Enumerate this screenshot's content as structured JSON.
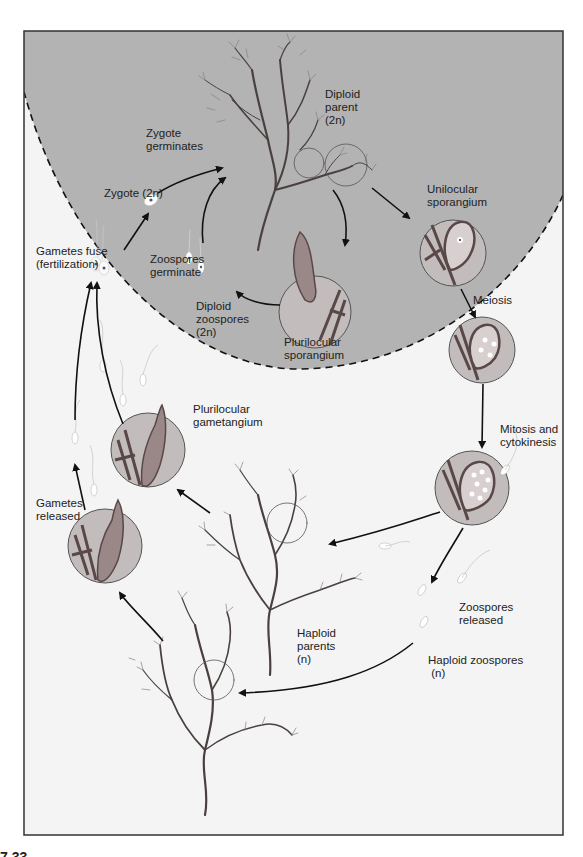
{
  "figure": {
    "number_partial": "7.33",
    "colors": {
      "diploid_region": "#b3b3b3",
      "haploid_region": "#f4f4f4",
      "frame": "#333333",
      "arrow": "#111111",
      "thallus": "#4a4040",
      "circle_fill": "#c8c8c8",
      "cell_wall": "#5a4848"
    }
  },
  "labels": {
    "diploid_parent": "Diploid\nparent\n(2n)",
    "zygote_germinates": "Zygote\ngerminates",
    "zygote": "Zygote (2n)",
    "unilocular_sporangium": "Unilocular\nsporangium",
    "gametes_fuse": "Gametes fuse\n(fertilization)",
    "zoospores_germinate": "Zoospores\ngerminate",
    "diploid_zoospores": "Diploid\nzoospores\n(2n)",
    "plurilocular_sporangium": "Plurilocular\nsporangium",
    "meiosis": "Meiosis",
    "plurilocular_gametangium": "Plurilocular\ngametangium",
    "mitosis_cytokinesis": "Mitosis and\ncytokinesis",
    "gametes_released": "Gametes\nreleased",
    "zoospores_released": "Zoospores\nreleased",
    "haploid_parents": "Haploid\nparents\n(n)",
    "haploid_zoospores": "Haploid zoospores\n (n)"
  },
  "regions": {
    "diploid_phase": "2n",
    "haploid_phase": "n"
  }
}
